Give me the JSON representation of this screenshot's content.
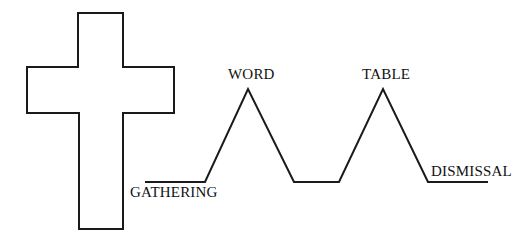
{
  "diagram": {
    "symbol": "cross-outline",
    "labels": {
      "gathering": "GATHERING",
      "word": "WORD",
      "table": "TABLE",
      "dismissal": "DISMISSAL"
    },
    "stroke_color": "#1a1a1a"
  }
}
